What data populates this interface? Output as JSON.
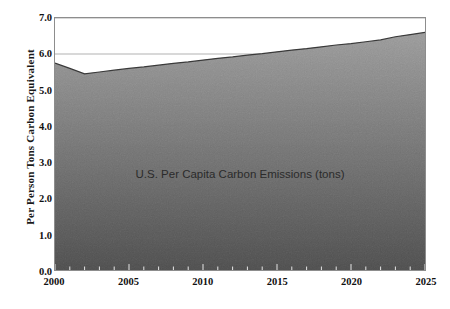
{
  "chart_data": {
    "type": "area",
    "title": "",
    "xlabel": "",
    "ylabel": "Per Person Tons Carbon Equivalent",
    "series_label": "U.S. Per Capita Carbon Emissions (tons)",
    "xlim": [
      2000,
      2025
    ],
    "ylim": [
      0.0,
      7.0
    ],
    "grid": true,
    "legend_position": "none",
    "x_tick_labels": [
      "2000",
      "2005",
      "2010",
      "2015",
      "2020",
      "2025"
    ],
    "x_tick_values": [
      2000,
      2005,
      2010,
      2015,
      2020,
      2025
    ],
    "x_minor_tick_step": 1,
    "y_tick_labels": [
      "0.0",
      "1.0",
      "2.0",
      "3.0",
      "4.0",
      "5.0",
      "6.0",
      "7.0"
    ],
    "y_tick_values": [
      0.0,
      1.0,
      2.0,
      3.0,
      4.0,
      5.0,
      6.0,
      7.0
    ],
    "x": [
      2000,
      2001,
      2002,
      2003,
      2004,
      2005,
      2006,
      2007,
      2008,
      2009,
      2010,
      2011,
      2012,
      2013,
      2014,
      2015,
      2016,
      2017,
      2018,
      2019,
      2020,
      2021,
      2022,
      2023,
      2024,
      2025
    ],
    "values": [
      5.75,
      5.6,
      5.45,
      5.5,
      5.55,
      5.6,
      5.64,
      5.69,
      5.74,
      5.78,
      5.83,
      5.88,
      5.92,
      5.97,
      6.01,
      6.06,
      6.11,
      6.15,
      6.2,
      6.25,
      6.29,
      6.34,
      6.39,
      6.48,
      6.54,
      6.6
    ],
    "colors": {
      "fill_top": "#b9b9b9",
      "fill_bottom": "#4e4e4e",
      "line": "#3a3a3a",
      "grid": "#b0b0b0",
      "axis": "#8d8d8d",
      "text": "#111111",
      "caption_text": "#2b2b2b",
      "background": "#ffffff"
    }
  }
}
